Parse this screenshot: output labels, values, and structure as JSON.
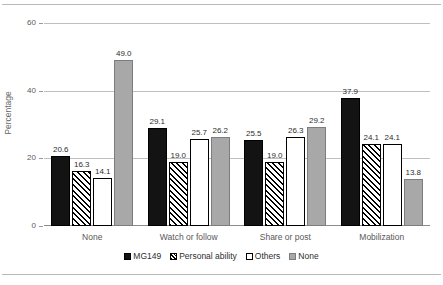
{
  "chart_data": {
    "type": "bar",
    "title": "",
    "subtitle": "",
    "xlabel": "",
    "ylabel": "Percentage",
    "ylim": [
      0,
      60
    ],
    "yticks": [
      0,
      20,
      40,
      60
    ],
    "ytick_labels": [
      "0",
      "20",
      "40",
      "60"
    ],
    "grid": "horizontal",
    "legend_position": "bottom",
    "categories": [
      "None",
      "Watch or follow",
      "Share or post",
      "Mobilization"
    ],
    "series": [
      {
        "name": "MG149",
        "style": "solid-black",
        "color": "#131313",
        "values": [
          20.6,
          29.1,
          25.5,
          37.9
        ],
        "labels": [
          "20.6",
          "29.1",
          "25.5",
          "37.9"
        ]
      },
      {
        "name": "Personal ability",
        "style": "diagonal-hatch",
        "color": "#000000",
        "values": [
          16.3,
          19.0,
          19.0,
          24.1
        ],
        "labels": [
          "16.3",
          "19.0",
          "19.0",
          "24.1"
        ]
      },
      {
        "name": "Others",
        "style": "white-outline",
        "color": "#ffffff",
        "values": [
          14.1,
          25.7,
          26.3,
          24.1
        ],
        "labels": [
          "14.1",
          "25.7",
          "26.3",
          "24.1"
        ]
      },
      {
        "name": "None",
        "style": "solid-gray",
        "color": "#a8a8a8",
        "values": [
          49.0,
          26.2,
          29.2,
          13.8
        ],
        "labels": [
          "49.0",
          "26.2",
          "29.2",
          "13.8"
        ]
      }
    ]
  },
  "axis": {
    "y_title": "Percentage",
    "y_ticks": [
      {
        "label": "60",
        "value": 60
      },
      {
        "label": "40",
        "value": 40
      },
      {
        "label": "20",
        "value": 20
      },
      {
        "label": "0",
        "value": 0
      }
    ]
  },
  "legend": {
    "items": [
      {
        "label": "MG149",
        "style": "s-mg149"
      },
      {
        "label": "Personal ability",
        "style": "s-personal"
      },
      {
        "label": "Others",
        "style": "s-others"
      },
      {
        "label": "None",
        "style": "s-none"
      }
    ]
  }
}
